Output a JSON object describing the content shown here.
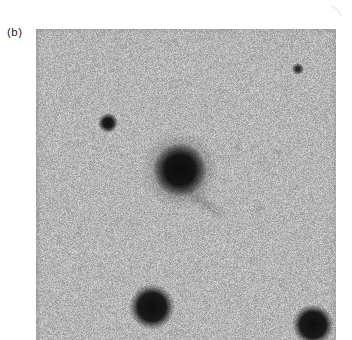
{
  "figure": {
    "panel_label": "(b)",
    "page_background": "#ffffff",
    "label_color": "#1c1c1c"
  },
  "image": {
    "x": 36,
    "y": 29,
    "width": 300,
    "height": 311,
    "background_mean_gray": 181,
    "noise_amplitude": 23,
    "edge_vignette_alpha": 0.07,
    "objects": [
      {
        "name": "central-galaxy",
        "type": "galaxy",
        "cx": 144,
        "cy": 141,
        "core_solid_r": 15,
        "core_outer_r": 27,
        "core_alpha": 0.96,
        "halo_outer_r": 39,
        "halo_alpha": 0.42
      },
      {
        "name": "star-medium-left",
        "type": "star",
        "cx": 72,
        "cy": 94,
        "solid_r": 5,
        "outer_r": 10,
        "alpha": 0.95
      },
      {
        "name": "star-small-top-right",
        "type": "star",
        "cx": 262,
        "cy": 40,
        "solid_r": 2,
        "outer_r": 6,
        "alpha": 0.85
      },
      {
        "name": "star-large-bottom-center",
        "type": "star",
        "cx": 116,
        "cy": 278,
        "solid_r": 14,
        "outer_r": 23,
        "alpha": 0.97
      },
      {
        "name": "star-large-bottom-right",
        "type": "star",
        "cx": 277,
        "cy": 296,
        "solid_r": 13,
        "outer_r": 21,
        "alpha": 0.97
      },
      {
        "name": "faint-trail-southeast-of-galaxy",
        "type": "streak",
        "cx": 168,
        "cy": 174,
        "length": 32,
        "width": 8,
        "angle_deg": 35,
        "alpha": 0.22
      },
      {
        "name": "faint-spot-1",
        "type": "spot",
        "cx": 201,
        "cy": 119,
        "r": 6,
        "alpha": 0.1
      },
      {
        "name": "faint-spot-2",
        "type": "spot",
        "cx": 242,
        "cy": 123,
        "r": 5,
        "alpha": 0.14
      },
      {
        "name": "faint-spot-3",
        "type": "spot",
        "cx": 224,
        "cy": 179,
        "r": 5,
        "alpha": 0.1
      },
      {
        "name": "faint-spot-4",
        "type": "spot",
        "cx": 261,
        "cy": 158,
        "r": 4,
        "alpha": 0.08
      },
      {
        "name": "faint-spot-5",
        "type": "spot",
        "cx": 42,
        "cy": 73,
        "r": 5,
        "alpha": 0.1
      },
      {
        "name": "faint-spot-6",
        "type": "spot",
        "cx": 136,
        "cy": 304,
        "r": 4,
        "alpha": 0.12
      }
    ]
  },
  "artifacts": {
    "margin_scratch_color": "#cccccc"
  }
}
